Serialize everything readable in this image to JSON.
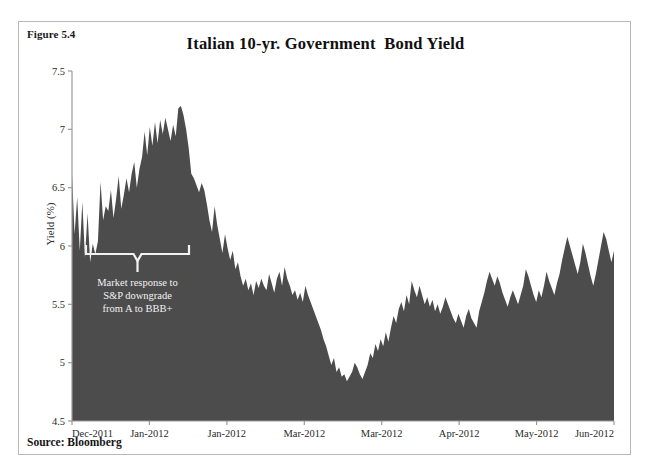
{
  "figure": {
    "label": "Figure 5.4",
    "source": "Source: Bloomberg"
  },
  "colors": {
    "area_fill": "#4c4c4c",
    "frame": "#b8b8b8",
    "axis": "#9a9a9a",
    "annotation": "#f2f2f2",
    "text": "#1a1a1a",
    "background": "#ffffff"
  },
  "annotation": {
    "line1": "Market response to",
    "line2": "S&P downgrade",
    "line3": "from A to BBB+"
  },
  "chart_data": {
    "type": "area",
    "title": "Italian 10-yr. Government  Bond Yield",
    "xlabel": "",
    "ylabel": "Yield (%)",
    "ylim": [
      4.5,
      7.5
    ],
    "yticks": [
      "4.5",
      "5",
      "5.5",
      "6",
      "6.5",
      "7",
      "7.5"
    ],
    "ytick_values": [
      4.5,
      5,
      5.5,
      6,
      6.5,
      7,
      7.5
    ],
    "grid": false,
    "legend": "none",
    "xtick_labels": [
      "Dec-2011",
      "Jan-2012",
      "Jan-2012",
      "Mar-2012",
      "Mar-2012",
      "Apr-2012",
      "May-2012",
      "Jun-2012"
    ],
    "series_name": "Italian 10-yr. Government Bond Yield",
    "values": [
      6.62,
      6.1,
      6.42,
      5.96,
      6.38,
      5.9,
      6.28,
      5.86,
      6.02,
      5.93,
      6.04,
      6.55,
      6.22,
      6.34,
      6.3,
      6.48,
      6.24,
      6.4,
      6.6,
      6.32,
      6.44,
      6.58,
      6.46,
      6.62,
      6.72,
      6.5,
      6.66,
      6.76,
      6.98,
      6.78,
      7.02,
      6.86,
      7.06,
      6.88,
      7.08,
      6.96,
      7.1,
      7.0,
      6.9,
      7.04,
      6.94,
      7.18,
      7.2,
      7.12,
      7.0,
      6.84,
      6.62,
      6.58,
      6.52,
      6.46,
      6.54,
      6.48,
      6.36,
      6.22,
      6.12,
      6.34,
      6.18,
      6.06,
      5.94,
      6.1,
      5.98,
      5.88,
      5.96,
      5.8,
      5.86,
      5.74,
      5.66,
      5.72,
      5.62,
      5.68,
      5.58,
      5.7,
      5.64,
      5.72,
      5.66,
      5.62,
      5.76,
      5.68,
      5.6,
      5.72,
      5.78,
      5.66,
      5.82,
      5.72,
      5.66,
      5.58,
      5.62,
      5.54,
      5.6,
      5.52,
      5.66,
      5.58,
      5.52,
      5.46,
      5.4,
      5.34,
      5.28,
      5.2,
      5.14,
      5.06,
      4.98,
      5.04,
      4.92,
      4.96,
      4.88,
      4.9,
      4.84,
      4.88,
      4.92,
      5.0,
      4.96,
      4.9,
      4.86,
      4.92,
      4.98,
      5.08,
      5.04,
      5.16,
      5.1,
      5.2,
      5.14,
      5.26,
      5.18,
      5.3,
      5.4,
      5.34,
      5.46,
      5.52,
      5.44,
      5.58,
      5.5,
      5.7,
      5.62,
      5.56,
      5.66,
      5.58,
      5.5,
      5.56,
      5.48,
      5.54,
      5.44,
      5.5,
      5.42,
      5.48,
      5.56,
      5.5,
      5.44,
      5.38,
      5.34,
      5.42,
      5.36,
      5.3,
      5.4,
      5.46,
      5.38,
      5.34,
      5.3,
      5.44,
      5.52,
      5.6,
      5.7,
      5.78,
      5.72,
      5.66,
      5.74,
      5.68,
      5.6,
      5.54,
      5.48,
      5.56,
      5.62,
      5.56,
      5.5,
      5.58,
      5.66,
      5.8,
      5.74,
      5.66,
      5.58,
      5.52,
      5.62,
      5.56,
      5.66,
      5.78,
      5.7,
      5.64,
      5.58,
      5.68,
      5.76,
      5.88,
      5.98,
      6.08,
      6.0,
      5.92,
      5.84,
      5.76,
      5.86,
      6.02,
      5.94,
      5.84,
      5.74,
      5.66,
      5.76,
      5.88,
      6.0,
      6.12,
      6.06,
      5.96,
      5.86,
      5.96
    ]
  }
}
